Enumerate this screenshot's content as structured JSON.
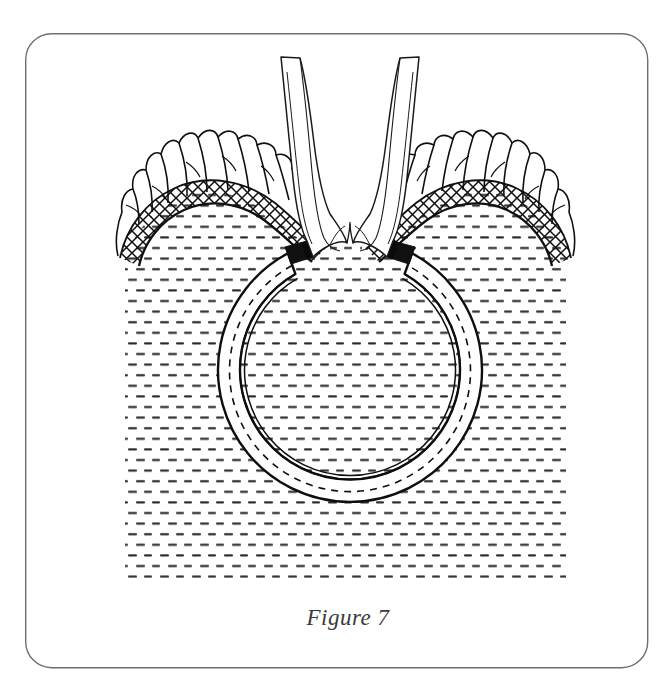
{
  "figure": {
    "caption": "Figure 7",
    "frame": {
      "x": 25,
      "y": 33,
      "width": 623,
      "height": 635,
      "corner_radius": 26,
      "stroke_color": "#6e6e6e",
      "stroke_width": 1.4,
      "fill_color": "#ffffff"
    },
    "background_color": "#ffffff",
    "ink_color": "#111111",
    "stipple_color": "#2b2b2b"
  },
  "illustration": {
    "title": "Figure 7",
    "subject": "Anatomical cross-section line drawing: a ring-shaped implant seated in stippled tissue beneath two converging mucosal folds",
    "tissue_field": {
      "name": "stippled-tissue-field",
      "description": "Dense field of short horizontal dashes representing sectioned tissue",
      "left": 125,
      "right": 566,
      "top": 196,
      "bottom": 578,
      "row_spacing": 10.6,
      "dash_length": 9,
      "dash_gap": 7,
      "dash_thickness": 2.1,
      "row_offset": 8
    },
    "ring": {
      "name": "ring-implant",
      "center_x": 350,
      "center_y": 376,
      "outer_radius": 132,
      "band_width": 22,
      "gap_top_start_deg": -118,
      "gap_top_end_deg": -62,
      "outer_stroke_width": 2.4,
      "inner_double_line_gap": 3.5,
      "dashed_line_dash": "7 6",
      "fill_color": "#ffffff",
      "end_block_left_x": 305,
      "end_block_left_y": 251,
      "end_block_right_x": 389,
      "end_block_right_y": 251
    },
    "hatched_arcs": [
      {
        "name": "left-crosshatch-band",
        "side": "left",
        "description": "Diagonal cross-hatched arching band over the left shoulder of tissue",
        "crosshatch_spacing": 11,
        "crosshatch_angle_deg": 38
      },
      {
        "name": "right-crosshatch-band",
        "side": "right",
        "description": "Diagonal cross-hatched arching band over the right shoulder of tissue",
        "crosshatch_spacing": 11,
        "crosshatch_angle_deg": -38
      }
    ],
    "fringes": [
      {
        "name": "left-villous-fringe",
        "side": "left",
        "description": "Irregular jagged villous fringe crowning the left hatched band",
        "tuft_count": 11
      },
      {
        "name": "right-villous-fringe",
        "side": "right",
        "description": "Irregular jagged villous fringe crowning the right hatched band",
        "tuft_count": 11
      }
    ],
    "folds": [
      {
        "name": "left-mucosal-fold",
        "side": "left",
        "top_y": 55,
        "bottom_y": 250,
        "description": "Tapering vertical fold descending from the top of the frame and curving inward"
      },
      {
        "name": "right-mucosal-fold",
        "side": "right",
        "top_y": 55,
        "bottom_y": 250,
        "description": "Tapering vertical fold descending from the top of the frame and curving inward"
      }
    ],
    "cleft": {
      "name": "central-cleft",
      "x": 349,
      "y": 246,
      "description": "Small midline cleft where the two folds meet above the ring gap"
    },
    "caption_block": {
      "name": "figure-caption",
      "x": 348,
      "y": 625,
      "font_size": 23,
      "style": "italic serif"
    }
  }
}
